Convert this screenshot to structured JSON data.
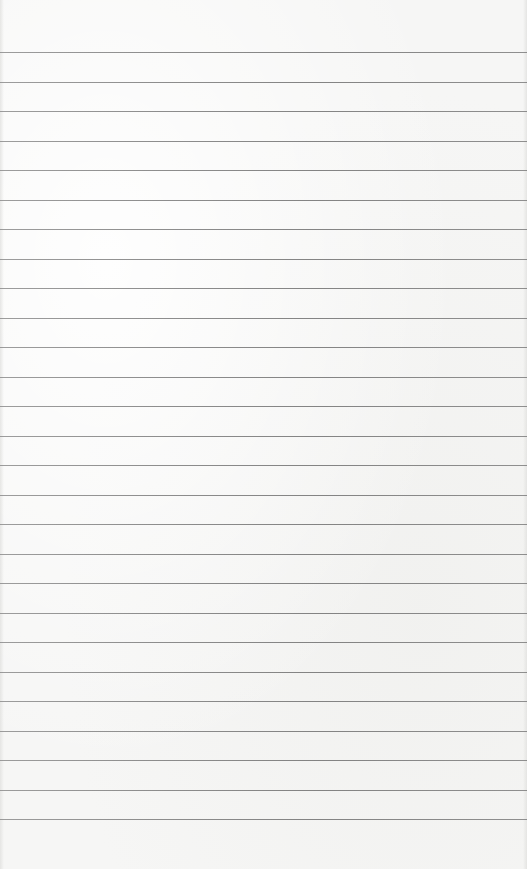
{
  "page": {
    "type": "lined-paper",
    "background_color": "#f6f6f5",
    "rule_color": "#7a7a7a",
    "rule_count": 27,
    "first_rule_y": 52,
    "rule_spacing": 29.5
  }
}
